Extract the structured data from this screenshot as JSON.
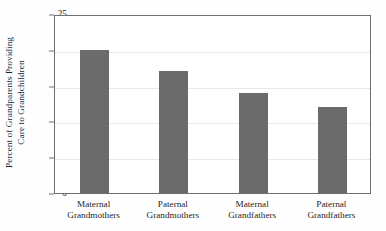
{
  "chart_data": {
    "type": "bar",
    "title": "",
    "xlabel": "",
    "ylabel_line1": "Percent of Grandparents Providing",
    "ylabel_line2": "Care to Grandchildren",
    "categories": [
      {
        "line1": "Maternal",
        "line2": "Grandmothers"
      },
      {
        "line1": "Paternal",
        "line2": "Grandmothers"
      },
      {
        "line1": "Maternal",
        "line2": "Grandfathers"
      },
      {
        "line1": "Paternal",
        "line2": "Grandfathers"
      }
    ],
    "values": [
      20,
      17,
      14,
      12
    ],
    "ylim": [
      0,
      25
    ],
    "yticks": [
      0,
      5,
      10,
      15,
      20,
      25
    ],
    "ytick_labels": [
      "0",
      "5",
      "10",
      "15",
      "20",
      "25"
    ],
    "grid": true,
    "legend": "none",
    "bar_color": "#6b6b6b",
    "grid_color": "#e8e8e8",
    "axis_color": "#6e6e6e",
    "background_color": "#ffffff"
  }
}
